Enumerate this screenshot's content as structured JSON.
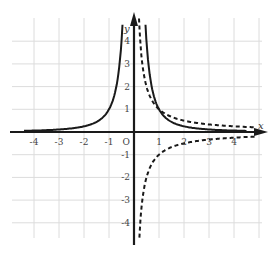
{
  "chart_data": {
    "type": "line",
    "title": "",
    "xlabel": "x",
    "ylabel": "y",
    "origin_label": "O",
    "xlim": [
      -4.4,
      4.8
    ],
    "ylim": [
      -4.5,
      5
    ],
    "grid": true,
    "x_ticks": [
      -4,
      -3,
      -2,
      -1,
      1,
      2,
      3,
      4
    ],
    "y_ticks": [
      -4,
      -3,
      -2,
      -1,
      1,
      2,
      3,
      4
    ],
    "x_tick_labels": [
      "-4",
      "-3",
      "-2",
      "-1",
      "1",
      "2",
      "3",
      "4"
    ],
    "y_tick_labels": [
      "-4",
      "-3",
      "-2",
      "-1",
      "1",
      "2",
      "3",
      "4"
    ],
    "series": [
      {
        "name": "solid curve (y = 1/x²)",
        "style": "solid",
        "color": "#1a1a1a",
        "x": [
          -4.2,
          -3,
          -2,
          -1.5,
          -1,
          -0.8,
          -0.6,
          -0.5,
          -0.45,
          0.45,
          0.5,
          0.6,
          0.8,
          1,
          1.5,
          2,
          3,
          4.2
        ],
        "y": [
          0.06,
          0.11,
          0.25,
          0.44,
          1,
          1.56,
          2.78,
          4,
          4.94,
          4.94,
          4,
          2.78,
          1.56,
          1,
          0.44,
          0.25,
          0.11,
          0.06
        ]
      },
      {
        "name": "dashed curve upper (y = 1/x, x>0)",
        "style": "dashed",
        "color": "#1a1a1a",
        "x": [
          0.2,
          0.25,
          0.3,
          0.4,
          0.5,
          0.7,
          1,
          1.5,
          2,
          3,
          4,
          4.8
        ],
        "y": [
          5,
          4,
          3.33,
          2.5,
          2,
          1.43,
          1,
          0.67,
          0.5,
          0.33,
          0.25,
          0.21
        ]
      },
      {
        "name": "dashed curve lower (y = -1/x, x>0)",
        "style": "dashed",
        "color": "#1a1a1a",
        "x": [
          0.22,
          0.25,
          0.3,
          0.4,
          0.5,
          0.7,
          1,
          1.5,
          2,
          3,
          4,
          4.8
        ],
        "y": [
          -4.5,
          -4,
          -3.33,
          -2.5,
          -2,
          -1.43,
          -1,
          -0.67,
          -0.5,
          -0.33,
          -0.25,
          -0.21
        ]
      }
    ]
  }
}
